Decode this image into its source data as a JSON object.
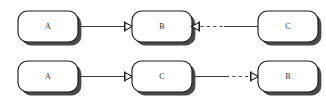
{
  "diagram": {
    "type": "node-link-diagram",
    "width": 326,
    "height": 103,
    "background_color": "#ffffff",
    "node_fill_color": "#ffffff",
    "node_border_color": "#1c1c1c",
    "node_shadow_color": "#3a3a3a",
    "edge_color": "#3c3c3c",
    "label_color": "#2b2b2b",
    "rows": [
      {
        "row_name": "top-sequence",
        "nodes": [
          {
            "id": "row1-node-1",
            "label": "A",
            "x": 18,
            "y": 11,
            "width": 60,
            "height": 31
          },
          {
            "id": "row1-node-2",
            "label": "B",
            "x": 132,
            "y": 11,
            "width": 60,
            "height": 31
          },
          {
            "id": "row1-node-3",
            "label": "C",
            "x": 258,
            "y": 11,
            "width": 60,
            "height": 31
          }
        ],
        "edges": [
          {
            "id": "row1-edge-1",
            "from": "row1-node-1",
            "to": "row1-node-2",
            "style": "solid",
            "target_connector": "arrow-into-node"
          },
          {
            "id": "row1-edge-2",
            "from": "row1-node-2",
            "to": "row1-node-3",
            "style": "dashed-then-solid",
            "source_connector": "arrow-out-of-node"
          }
        ]
      },
      {
        "row_name": "bottom-sequence",
        "nodes": [
          {
            "id": "row2-node-1",
            "label": "A",
            "x": 18,
            "y": 61,
            "width": 60,
            "height": 31
          },
          {
            "id": "row2-node-2",
            "label": "C",
            "x": 132,
            "y": 61,
            "width": 60,
            "height": 31
          },
          {
            "id": "row2-node-3",
            "label": "B",
            "x": 258,
            "y": 61,
            "width": 60,
            "height": 31
          }
        ],
        "edges": [
          {
            "id": "row2-edge-1",
            "from": "row2-node-1",
            "to": "row2-node-2",
            "style": "solid",
            "target_connector": "arrow-into-node"
          },
          {
            "id": "row2-edge-2",
            "from": "row2-node-2",
            "to": "row2-node-3",
            "style": "solid-then-dashed",
            "target_connector": "arrow-into-node"
          }
        ]
      }
    ]
  }
}
